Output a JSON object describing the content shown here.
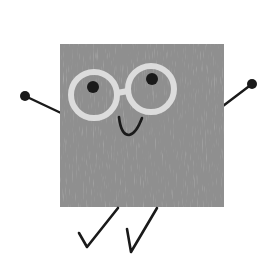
{
  "illustration": {
    "subject": "square character with glasses",
    "colors": {
      "background": "#ffffff",
      "body": "#8f8f8f",
      "body_texture": "#a4a4a4",
      "glasses": "#dcdcdc",
      "ink": "#1a1a1a"
    },
    "parts": {
      "body": {
        "x": 60,
        "y": 44,
        "width": 164,
        "height": 163
      },
      "left_lens": {
        "cx": 94,
        "cy": 95,
        "r": 23
      },
      "right_lens": {
        "cx": 151,
        "cy": 89,
        "r": 23
      },
      "left_pupil": {
        "cx": 93,
        "cy": 87,
        "r": 6
      },
      "right_pupil": {
        "cx": 152,
        "cy": 79,
        "r": 6
      },
      "left_hand": {
        "cx": 25,
        "cy": 96,
        "r": 5
      },
      "right_hand": {
        "cx": 252,
        "cy": 84,
        "r": 5
      }
    },
    "icons": [
      "smile-icon",
      "glasses-icon",
      "checkmark-leg-icon"
    ]
  }
}
